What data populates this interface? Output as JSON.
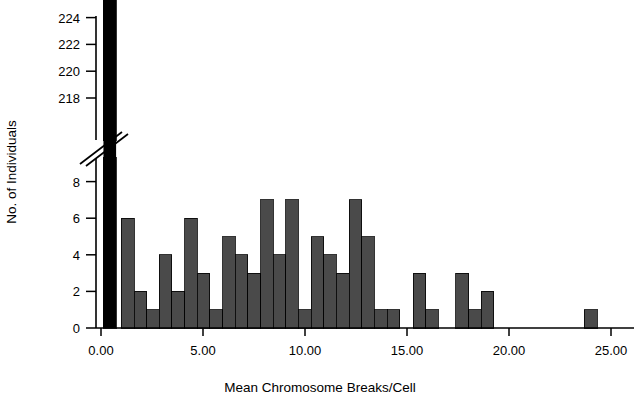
{
  "chart_data": {
    "type": "bar",
    "title": "",
    "xlabel": "Mean Chromosome Breaks/Cell",
    "ylabel": "No. of Individuals",
    "xlim": [
      -0.6,
      26.2
    ],
    "ylim": [
      0,
      9
    ],
    "grid": false,
    "legend": null,
    "axis_break": {
      "present": true,
      "lower_max": 9,
      "upper_min": 217,
      "upper_max": 225,
      "note": "y-axis broken between 9 and 217"
    },
    "xticks": [
      0,
      5,
      10,
      15,
      20,
      25
    ],
    "xtick_labels": [
      "0.00",
      "5.00",
      "10.00",
      "15.00",
      "20.00",
      "25.00"
    ],
    "yticks_lower": [
      0,
      2,
      4,
      6,
      8
    ],
    "ytick_labels_lower": [
      "0",
      "2",
      "4",
      "6",
      "8"
    ],
    "yticks_upper": [
      218,
      220,
      222,
      224
    ],
    "ytick_labels_upper": [
      "218",
      "220",
      "222",
      "224"
    ],
    "bin_width": 0.62,
    "bar_color": "#4a4a4a",
    "highlight_color": "#000000",
    "axis_color": "#000000",
    "bars": [
      {
        "x": 0.12,
        "value": 224,
        "clipped": true,
        "color": "#000000"
      },
      {
        "x": 1.0,
        "value": 6,
        "color": "#4a4a4a"
      },
      {
        "x": 1.62,
        "value": 2,
        "color": "#4a4a4a"
      },
      {
        "x": 2.24,
        "value": 1,
        "color": "#4a4a4a"
      },
      {
        "x": 2.86,
        "value": 4,
        "color": "#4a4a4a"
      },
      {
        "x": 3.48,
        "value": 2,
        "color": "#4a4a4a"
      },
      {
        "x": 4.1,
        "value": 6,
        "color": "#4a4a4a"
      },
      {
        "x": 4.72,
        "value": 3,
        "color": "#4a4a4a"
      },
      {
        "x": 5.34,
        "value": 1,
        "color": "#4a4a4a"
      },
      {
        "x": 5.96,
        "value": 5,
        "color": "#4a4a4a"
      },
      {
        "x": 6.58,
        "value": 4,
        "color": "#4a4a4a"
      },
      {
        "x": 7.2,
        "value": 3,
        "color": "#4a4a4a"
      },
      {
        "x": 7.82,
        "value": 7,
        "color": "#4a4a4a"
      },
      {
        "x": 8.44,
        "value": 4,
        "color": "#4a4a4a"
      },
      {
        "x": 9.06,
        "value": 7,
        "color": "#4a4a4a"
      },
      {
        "x": 9.68,
        "value": 1,
        "color": "#4a4a4a"
      },
      {
        "x": 10.3,
        "value": 5,
        "color": "#4a4a4a"
      },
      {
        "x": 10.92,
        "value": 4,
        "color": "#4a4a4a"
      },
      {
        "x": 11.54,
        "value": 3,
        "color": "#4a4a4a"
      },
      {
        "x": 12.16,
        "value": 7,
        "color": "#4a4a4a"
      },
      {
        "x": 12.78,
        "value": 5,
        "color": "#4a4a4a"
      },
      {
        "x": 13.4,
        "value": 1,
        "color": "#4a4a4a"
      },
      {
        "x": 14.02,
        "value": 1,
        "color": "#4a4a4a"
      },
      {
        "x": 15.3,
        "value": 3,
        "color": "#4a4a4a"
      },
      {
        "x": 15.92,
        "value": 1,
        "color": "#4a4a4a"
      },
      {
        "x": 17.4,
        "value": 3,
        "color": "#4a4a4a"
      },
      {
        "x": 18.02,
        "value": 1,
        "color": "#4a4a4a"
      },
      {
        "x": 18.64,
        "value": 2,
        "color": "#4a4a4a"
      },
      {
        "x": 23.7,
        "value": 1,
        "color": "#4a4a4a"
      }
    ]
  }
}
